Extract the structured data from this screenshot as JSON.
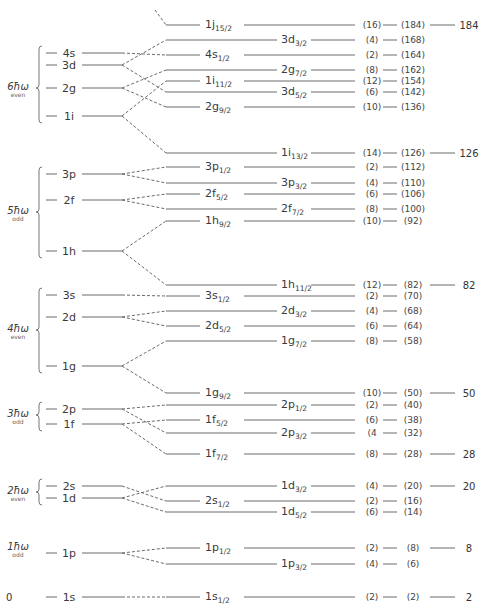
{
  "chart_data": {
    "type": "diagram",
    "shells": [
      {
        "label": "0",
        "parity": "",
        "y": 597,
        "orbitals": [
          {
            "name": "1s",
            "y": 597
          }
        ]
      },
      {
        "label": "1ħω",
        "parity": "odd",
        "y": 548,
        "orbitals": [
          {
            "name": "1p",
            "y": 553
          }
        ]
      },
      {
        "label": "2ħω",
        "parity": "even",
        "y": 492,
        "orbitals": [
          {
            "name": "2s",
            "y": 486
          },
          {
            "name": "1d",
            "y": 498
          }
        ]
      },
      {
        "label": "3ħω",
        "parity": "odd",
        "y": 415,
        "orbitals": [
          {
            "name": "2p",
            "y": 409
          },
          {
            "name": "1f",
            "y": 424
          }
        ]
      },
      {
        "label": "4ħω",
        "parity": "even",
        "y": 330,
        "orbitals": [
          {
            "name": "3s",
            "y": 295
          },
          {
            "name": "2d",
            "y": 317
          },
          {
            "name": "1g",
            "y": 366
          }
        ]
      },
      {
        "label": "5ħω",
        "parity": "odd",
        "y": 212,
        "orbitals": [
          {
            "name": "3p",
            "y": 174
          },
          {
            "name": "2f",
            "y": 200
          },
          {
            "name": "1h",
            "y": 251
          }
        ]
      },
      {
        "label": "6ħω",
        "parity": "even",
        "y": 88,
        "orbitals": [
          {
            "name": "4s",
            "y": 53
          },
          {
            "name": "3d",
            "y": 65
          },
          {
            "name": "2g",
            "y": 88
          },
          {
            "name": "1i",
            "y": 116
          }
        ]
      }
    ],
    "levels": [
      {
        "orbital": "1j",
        "j": "15/2",
        "y": 25,
        "deg": "(16)",
        "cum": "(184)",
        "magic": "184",
        "label_pos": "left",
        "from_y": 10,
        "dashed_only": true
      },
      {
        "orbital": "3d",
        "j": "3/2",
        "y": 40,
        "deg": "(4)",
        "cum": "(168)",
        "magic": "",
        "label_pos": "right",
        "from_y": 65
      },
      {
        "orbital": "4s",
        "j": "1/2",
        "y": 55,
        "deg": "(2)",
        "cum": "(164)",
        "magic": "",
        "label_pos": "left",
        "from_y": 53
      },
      {
        "orbital": "2g",
        "j": "7/2",
        "y": 70,
        "deg": "(8)",
        "cum": "(162)",
        "magic": "",
        "label_pos": "right",
        "from_y": 88
      },
      {
        "orbital": "1i",
        "j": "11/2",
        "y": 81,
        "deg": "(12)",
        "cum": "(154)",
        "magic": "",
        "label_pos": "left",
        "from_y": 116
      },
      {
        "orbital": "3d",
        "j": "5/2",
        "y": 92,
        "deg": "(6)",
        "cum": "(142)",
        "magic": "",
        "label_pos": "right",
        "from_y": 65
      },
      {
        "orbital": "2g",
        "j": "9/2",
        "y": 107,
        "deg": "(10)",
        "cum": "(136)",
        "magic": "",
        "label_pos": "left",
        "from_y": 88
      },
      {
        "orbital": "1i",
        "j": "13/2",
        "y": 153,
        "deg": "(14)",
        "cum": "(126)",
        "magic": "126",
        "label_pos": "right",
        "from_y": 116
      },
      {
        "orbital": "3p",
        "j": "1/2",
        "y": 167,
        "deg": "(2)",
        "cum": "(112)",
        "magic": "",
        "label_pos": "left",
        "from_y": 174
      },
      {
        "orbital": "3p",
        "j": "3/2",
        "y": 183,
        "deg": "(4)",
        "cum": "(110)",
        "magic": "",
        "label_pos": "right",
        "from_y": 174
      },
      {
        "orbital": "2f",
        "j": "5/2",
        "y": 194,
        "deg": "(6)",
        "cum": "(106)",
        "magic": "",
        "label_pos": "left",
        "from_y": 200
      },
      {
        "orbital": "2f",
        "j": "7/2",
        "y": 209,
        "deg": "(8)",
        "cum": "(100)",
        "magic": "",
        "label_pos": "right",
        "from_y": 200
      },
      {
        "orbital": "1h",
        "j": "9/2",
        "y": 221,
        "deg": "(10)",
        "cum": "(92)",
        "magic": "",
        "label_pos": "left",
        "from_y": 251
      },
      {
        "orbital": "1h",
        "j": "11/2",
        "y": 285,
        "deg": "(12)",
        "cum": "(82)",
        "magic": "82",
        "label_pos": "right",
        "from_y": 251
      },
      {
        "orbital": "3s",
        "j": "1/2",
        "y": 296,
        "deg": "(2)",
        "cum": "(70)",
        "magic": "",
        "label_pos": "left",
        "from_y": 295
      },
      {
        "orbital": "2d",
        "j": "3/2",
        "y": 311,
        "deg": "(4)",
        "cum": "(68)",
        "magic": "",
        "label_pos": "right",
        "from_y": 317
      },
      {
        "orbital": "2d",
        "j": "5/2",
        "y": 326,
        "deg": "(6)",
        "cum": "(64)",
        "magic": "",
        "label_pos": "left",
        "from_y": 317
      },
      {
        "orbital": "1g",
        "j": "7/2",
        "y": 341,
        "deg": "(8)",
        "cum": "(58)",
        "magic": "",
        "label_pos": "right",
        "from_y": 366
      },
      {
        "orbital": "1g",
        "j": "9/2",
        "y": 393,
        "deg": "(10)",
        "cum": "(50)",
        "magic": "50",
        "label_pos": "left",
        "from_y": 366
      },
      {
        "orbital": "2p",
        "j": "1/2",
        "y": 405,
        "deg": "(2)",
        "cum": "(40)",
        "magic": "",
        "label_pos": "right",
        "from_y": 409
      },
      {
        "orbital": "1f",
        "j": "5/2",
        "y": 420,
        "deg": "(6)",
        "cum": "(38)",
        "magic": "",
        "label_pos": "left",
        "from_y": 424
      },
      {
        "orbital": "2p",
        "j": "3/2",
        "y": 433,
        "deg": "(4",
        "cum": "(32)",
        "magic": "",
        "label_pos": "right",
        "from_y": 409
      },
      {
        "orbital": "1f",
        "j": "7/2",
        "y": 454,
        "deg": "(8)",
        "cum": "(28)",
        "magic": "28",
        "label_pos": "left",
        "from_y": 424
      },
      {
        "orbital": "1d",
        "j": "3/2",
        "y": 486,
        "deg": "(4)",
        "cum": "(20)",
        "magic": "20",
        "label_pos": "right",
        "from_y": 498
      },
      {
        "orbital": "2s",
        "j": "1/2",
        "y": 501,
        "deg": "(2)",
        "cum": "(16)",
        "magic": "",
        "label_pos": "left",
        "from_y": 486
      },
      {
        "orbital": "1d",
        "j": "5/2",
        "y": 512,
        "deg": "(6)",
        "cum": "(14)",
        "magic": "",
        "label_pos": "right",
        "from_y": 498
      },
      {
        "orbital": "1p",
        "j": "1/2",
        "y": 548,
        "deg": "(2)",
        "cum": "(8)",
        "magic": "8",
        "label_pos": "left",
        "from_y": 553
      },
      {
        "orbital": "1p",
        "j": "3/2",
        "y": 564,
        "deg": "(4)",
        "cum": "(6)",
        "magic": "",
        "label_pos": "right",
        "from_y": 553
      },
      {
        "orbital": "1s",
        "j": "1/2",
        "y": 597,
        "deg": "(2)",
        "cum": "(2)",
        "magic": "2",
        "label_pos": "left",
        "from_y": 597
      }
    ],
    "magic_numbers": [
      2,
      8,
      20,
      28,
      50,
      82,
      126,
      184
    ],
    "colors": {
      "line": "#6a6a6a",
      "text": "#3a3a3a"
    }
  }
}
